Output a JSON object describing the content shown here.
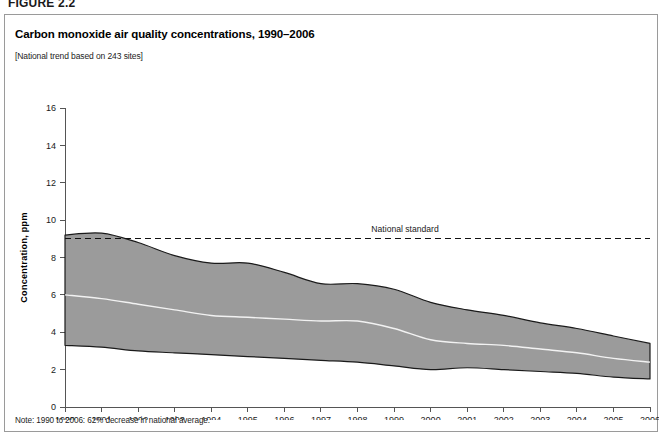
{
  "figure": {
    "label": "FIGURE 2.2",
    "title": "Carbon monoxide air quality concentrations, 1990–2006",
    "subtitle": "[National trend based on 243 sites]",
    "note": "Note: 1990 to 2006: 62% decrease in national average."
  },
  "colors": {
    "band_fill": "#9b9b9b",
    "band_edge": "#1a1a1a",
    "mean_line": "#f2f2f2",
    "standard_line": "#111111",
    "axis": "#555555",
    "frame": "#9a9a9a",
    "background": "#ffffff"
  },
  "chart_data": {
    "type": "area",
    "title": "Carbon monoxide air quality concentrations, 1990–2006",
    "subtitle": "[National trend based on 243 sites]",
    "xlabel": "",
    "ylabel": "Concentration, ppm",
    "xlim": [
      1990,
      2006
    ],
    "ylim": [
      0,
      16
    ],
    "ytick_step": 2,
    "grid": false,
    "legend_position": "none",
    "x": [
      1990,
      1991,
      1992,
      1993,
      1994,
      1995,
      1996,
      1997,
      1998,
      1999,
      2000,
      2001,
      2002,
      2003,
      2004,
      2005,
      2006
    ],
    "xtick_labels": [
      "1990",
      "1991",
      "1992",
      "1993",
      "1994",
      "1995",
      "1996",
      "1997",
      "1998",
      "1999",
      "2000",
      "2001",
      "2002",
      "2003",
      "2004",
      "2005",
      "2006"
    ],
    "ytick_labels": [
      "0",
      "2",
      "4",
      "6",
      "8",
      "10",
      "12",
      "14",
      "16"
    ],
    "series": [
      {
        "name": "90th percentile",
        "role": "band_upper",
        "values": [
          9.2,
          9.3,
          8.8,
          8.1,
          7.7,
          7.7,
          7.2,
          6.6,
          6.6,
          6.3,
          5.6,
          5.2,
          4.9,
          4.5,
          4.2,
          3.8,
          3.4
        ]
      },
      {
        "name": "National average (mean)",
        "role": "mean",
        "values": [
          6.0,
          5.8,
          5.5,
          5.2,
          4.9,
          4.8,
          4.7,
          4.6,
          4.6,
          4.2,
          3.6,
          3.4,
          3.3,
          3.1,
          2.9,
          2.6,
          2.4
        ]
      },
      {
        "name": "10th percentile",
        "role": "band_lower",
        "values": [
          3.3,
          3.2,
          3.0,
          2.9,
          2.8,
          2.7,
          2.6,
          2.5,
          2.4,
          2.2,
          2.0,
          2.1,
          2.0,
          1.9,
          1.8,
          1.6,
          1.5
        ]
      }
    ],
    "annotations": [
      {
        "name": "national-standard",
        "label": "National standard",
        "type": "hline",
        "y": 9.0,
        "label_x": 1999.3,
        "style": "dashed"
      }
    ]
  }
}
